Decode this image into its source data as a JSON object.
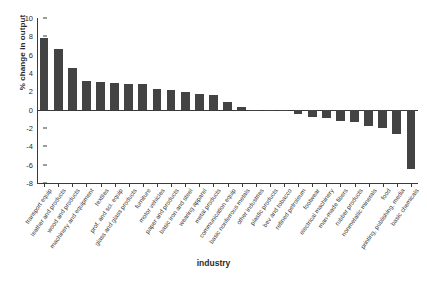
{
  "chart_data": {
    "type": "bar",
    "title": "",
    "xlabel": "industry",
    "ylabel": "% change in output",
    "ylim": [
      -8,
      10
    ],
    "yticks": [
      10,
      8,
      6,
      4,
      2,
      0,
      -2,
      -4,
      -6,
      -8
    ],
    "grid": false,
    "legend": "none",
    "bar_color": "#434343",
    "categories": [
      "transport equip",
      "leather and products",
      "wood and products",
      "machinery and equipment",
      "textiles",
      "prof. and sci. equip",
      "glass and glass products",
      "furniture",
      "motor vehicles",
      "paper and products",
      "basic iron and steel",
      "wearing apparel",
      "metal products",
      "communication equip",
      "basic nonferrous metals",
      "other industries",
      "plastic products",
      "bev and tobacco",
      "refined petroleum",
      "footwear",
      "electrical machinery",
      "man-made fibers",
      "rubber products",
      "nonmetallic minerals",
      "food",
      "printing, publishing, media",
      "basic chemicals"
    ],
    "values": [
      7.8,
      6.6,
      4.5,
      3.1,
      3.0,
      2.95,
      2.85,
      2.85,
      2.25,
      2.15,
      1.95,
      1.75,
      1.55,
      0.85,
      0.3,
      -0.05,
      -0.1,
      -0.15,
      -0.5,
      -0.8,
      -0.95,
      -1.2,
      -1.3,
      -1.75,
      -2.0,
      -2.7,
      -6.5
    ]
  },
  "axes": {
    "y_title": "% change in output",
    "x_title": "industry"
  }
}
